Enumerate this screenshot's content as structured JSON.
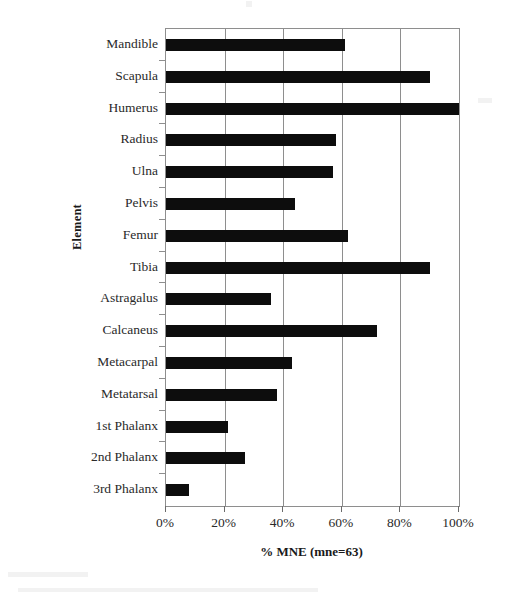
{
  "chart_data": {
    "type": "bar",
    "orientation": "horizontal",
    "title": "",
    "xlabel": "% MNE (mne=63)",
    "ylabel": "Element",
    "xlim": [
      0,
      100
    ],
    "xticks": [
      "0%",
      "20%",
      "40%",
      "60%",
      "80%",
      "100%"
    ],
    "xtick_values": [
      0,
      20,
      40,
      60,
      80,
      100
    ],
    "grid": "vertical",
    "legend": "none",
    "bar_color": "#0d0d0d",
    "categories": [
      "Mandible",
      "Scapula",
      "Humerus",
      "Radius",
      "Ulna",
      "Pelvis",
      "Femur",
      "Tibia",
      "Astragalus",
      "Calcaneus",
      "Metacarpal",
      "Metatarsal",
      "1st Phalanx",
      "2nd Phalanx",
      "3rd Phalanx"
    ],
    "values": [
      61,
      90,
      100,
      58,
      57,
      44,
      62,
      90,
      36,
      72,
      43,
      38,
      21,
      27,
      8
    ],
    "series": [
      {
        "name": "% MNE",
        "values": [
          61,
          90,
          100,
          58,
          57,
          44,
          62,
          90,
          36,
          72,
          43,
          38,
          21,
          27,
          8
        ]
      }
    ]
  },
  "axes": {
    "y_title": "Element",
    "x_title": "% MNE (mne=63)"
  }
}
